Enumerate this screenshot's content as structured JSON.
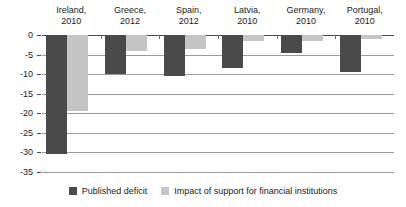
{
  "chart_data": {
    "type": "bar",
    "title": "",
    "subtitle": "",
    "xlabel": "",
    "ylabel": "",
    "ylim": [
      -35,
      0
    ],
    "ytick_labels": [
      "0",
      "-5",
      "-10",
      "-15",
      "-20",
      "-25",
      "-30",
      "-35"
    ],
    "ytick_values": [
      0,
      -5,
      -10,
      -15,
      -20,
      -25,
      -30,
      -35
    ],
    "grid": true,
    "legend_position": "bottom",
    "orientation": "vertical",
    "grouped": true,
    "categories": [
      "Ireland,\n2010",
      "Greece,\n2012",
      "Spain,\n2012",
      "Latvia,\n2010",
      "Germany,\n2010",
      "Portugal,\n2010"
    ],
    "category_lines": [
      [
        "Ireland,",
        "2010"
      ],
      [
        "Greece,",
        "2012"
      ],
      [
        "Spain,",
        "2012"
      ],
      [
        "Latvia,",
        "2010"
      ],
      [
        "Germany,",
        "2010"
      ],
      [
        "Portugal,",
        "2010"
      ]
    ],
    "series": [
      {
        "name": "Published deficit",
        "color": "#4a4a4a",
        "values": [
          -30.5,
          -10.0,
          -10.5,
          -8.5,
          -4.5,
          -9.5
        ]
      },
      {
        "name": "Impact of support for financial institutions",
        "color": "#c5c5c5",
        "values": [
          -19.5,
          -4.0,
          -3.5,
          -1.5,
          -1.5,
          -1.0
        ]
      }
    ]
  },
  "legend": {
    "items": [
      {
        "label": "Published deficit",
        "color": "#4a4a4a"
      },
      {
        "label": "Impact of support for financial institutions",
        "color": "#c5c5c5"
      }
    ]
  },
  "colors": {
    "series_dark": "#4a4a4a",
    "series_light": "#c5c5c5",
    "gridline": "#9a9a9a",
    "axis": "#4a4a4a",
    "text": "#1a1a1a",
    "background": "#ffffff"
  }
}
